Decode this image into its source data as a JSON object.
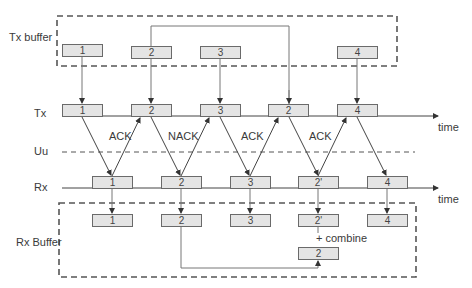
{
  "diagram": {
    "labels": {
      "tx_buffer": "Tx buffer",
      "tx": "Tx",
      "uu": "Uu",
      "rx": "Rx",
      "rx_buffer": "Rx Buffer",
      "time_tx": "time",
      "time_rx": "time",
      "combine": "+ combine"
    },
    "tx_buffer_packets": [
      "1",
      "2",
      "3",
      "4"
    ],
    "tx_packets": [
      "1",
      "2",
      "3",
      "2",
      "4"
    ],
    "rx_packets": [
      "1",
      "2",
      "3",
      "2'",
      "4"
    ],
    "rx_buffer_packets": [
      "1",
      "2",
      "3",
      "2'",
      "4"
    ],
    "combined_packet": "2",
    "feedback": [
      "ACK",
      "NACK",
      "ACK",
      "ACK"
    ],
    "colors": {
      "line": "#555555",
      "packet_fill": "#e4e4e4",
      "packet_border": "#6a6a6a",
      "text": "#333333"
    }
  }
}
